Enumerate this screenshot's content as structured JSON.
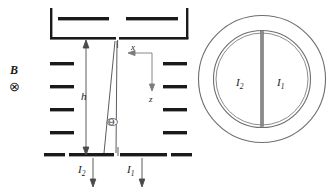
{
  "figure": {
    "title_absent": true,
    "side_view": {
      "field_label": "B",
      "field_direction_icon": "circled-x-into-page-icon",
      "field_direction_glyph": "⊗",
      "height_label": "h",
      "axis_x_label": "x",
      "axis_z_label": "z",
      "angle_label": "Θ",
      "current_left_label": "I",
      "current_left_sub": "2",
      "current_right_label": "I",
      "current_right_sub": "1",
      "electrode_bars_left_count": 4,
      "electrode_bars_right_count": 4,
      "vessel_inner_bars_count": 2,
      "colors": {
        "line": "#1a1a1a",
        "thin_line": "#707070",
        "background": "#ffffff"
      }
    },
    "cross_section_view": {
      "current_left_label": "I",
      "current_left_sub": "2",
      "current_right_label": "I",
      "current_right_sub": "1",
      "outer_circle": "outer-wall-circle",
      "inner_ring": "inner-annulus-circle",
      "divider": "vertical-divider-bar",
      "colors": {
        "stroke": "#6e6e6e",
        "divider": "#8a8a8a"
      }
    }
  }
}
